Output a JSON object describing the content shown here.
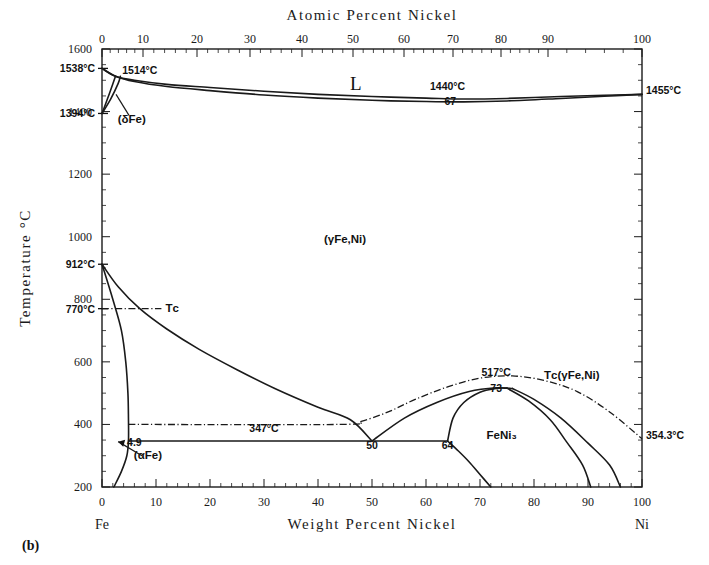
{
  "figure": {
    "caption": "(b)",
    "top_axis_title": "Atomic Percent Nickel",
    "bottom_axis_title": "Weight Percent Nickel",
    "left_axis_title": "Temperature °C",
    "left_end_label": "Fe",
    "right_end_label": "Ni",
    "frame": {
      "x0": 102,
      "x1": 642,
      "y_top": 49,
      "y_bottom": 487
    }
  },
  "chart_data": {
    "type": "line",
    "xlabel": "Weight Percent Nickel",
    "ylabel": "Temperature °C",
    "x2label": "Atomic Percent Nickel",
    "xlim": [
      0,
      100
    ],
    "ylim": [
      200,
      1600
    ],
    "grid": false,
    "legend": "none",
    "y_ticks": [
      200,
      400,
      600,
      800,
      1000,
      1200,
      1400,
      1600
    ],
    "x_ticks_bottom": [
      0,
      10,
      20,
      30,
      40,
      50,
      60,
      70,
      80,
      90,
      100
    ],
    "x_ticks_top": [
      0,
      10,
      20,
      30,
      40,
      50,
      60,
      70,
      80,
      90,
      100
    ],
    "x_top_pixel_positions": [
      102,
      143,
      197,
      250,
      302,
      353,
      404,
      453,
      501,
      548,
      642
    ],
    "special_y_ticks": [
      {
        "label": "1538°C",
        "value": 1538
      },
      {
        "label": "1394°C",
        "value": 1394
      },
      {
        "label": "912°C",
        "value": 912
      },
      {
        "label": "770°C",
        "value": 770
      }
    ],
    "phase_labels": [
      {
        "text": "L",
        "wt": 47,
        "temp": 1470
      },
      {
        "text": "(δFe)",
        "wt": 5.5,
        "temp": 1365
      },
      {
        "text": "(γFe,Ni)",
        "wt": 45,
        "temp": 980
      },
      {
        "text": "(αFe)",
        "wt": 8.5,
        "temp": 290
      },
      {
        "text": "FeNi₃",
        "wt": 74,
        "temp": 355
      },
      {
        "text": "Tᴄ",
        "wt": 13,
        "temp": 760
      },
      {
        "text": "Tᴄ(γFe,Ni)",
        "wt": 87,
        "temp": 545
      }
    ],
    "annotations": [
      {
        "text": "1514°C",
        "wt": 7,
        "temp": 1520
      },
      {
        "text": "1440°C",
        "wt": 64,
        "temp": 1470
      },
      {
        "text": "67",
        "wt": 64.5,
        "temp": 1420
      },
      {
        "text": "1455°C",
        "wt": 101,
        "temp": 1455
      },
      {
        "text": "347°C",
        "wt": 30,
        "temp": 375
      },
      {
        "text": "4.9",
        "wt": 6,
        "temp": 330
      },
      {
        "text": "50",
        "wt": 50,
        "temp": 320
      },
      {
        "text": "64",
        "wt": 64,
        "temp": 320
      },
      {
        "text": "517°C",
        "wt": 73,
        "temp": 555
      },
      {
        "text": "73",
        "wt": 73,
        "temp": 505
      },
      {
        "text": "354.3°C",
        "wt": 101,
        "temp": 354.3
      }
    ],
    "series": [
      {
        "name": "liquidus",
        "style": "solid",
        "points": [
          [
            0,
            1538
          ],
          [
            2.5,
            1513
          ],
          [
            6,
            1500
          ],
          [
            12,
            1487
          ],
          [
            20,
            1477
          ],
          [
            30,
            1465
          ],
          [
            40,
            1455
          ],
          [
            50,
            1448
          ],
          [
            60,
            1443
          ],
          [
            67,
            1440
          ],
          [
            75,
            1442
          ],
          [
            85,
            1448
          ],
          [
            93,
            1452
          ],
          [
            100,
            1455
          ]
        ]
      },
      {
        "name": "solidus",
        "style": "solid",
        "points": [
          [
            0,
            1538
          ],
          [
            2.5,
            1513
          ],
          [
            6,
            1496
          ],
          [
            12,
            1480
          ],
          [
            20,
            1467
          ],
          [
            30,
            1453
          ],
          [
            40,
            1443
          ],
          [
            50,
            1436
          ],
          [
            60,
            1432
          ],
          [
            67,
            1431
          ],
          [
            75,
            1434
          ],
          [
            85,
            1442
          ],
          [
            93,
            1449
          ],
          [
            100,
            1455
          ]
        ]
      },
      {
        "name": "delta-ferrite-boundary-left",
        "style": "solid",
        "points": [
          [
            0,
            1394
          ],
          [
            1.0,
            1440
          ],
          [
            2.0,
            1488
          ],
          [
            2.5,
            1513
          ]
        ]
      },
      {
        "name": "delta-gamma-boundary",
        "style": "solid",
        "points": [
          [
            0,
            1394
          ],
          [
            1.6,
            1440
          ],
          [
            3.0,
            1490
          ],
          [
            3.4,
            1513
          ]
        ]
      },
      {
        "name": "gamma-alpha-solvus-upper",
        "style": "solid",
        "points": [
          [
            0,
            912
          ],
          [
            3,
            840
          ],
          [
            7,
            770
          ],
          [
            12,
            705
          ],
          [
            18,
            640
          ],
          [
            25,
            575
          ],
          [
            32,
            515
          ],
          [
            40,
            455
          ],
          [
            46,
            415
          ],
          [
            50,
            347
          ]
        ]
      },
      {
        "name": "alpha-gamma-boundary-left",
        "style": "solid",
        "points": [
          [
            0,
            912
          ],
          [
            2.0,
            800
          ],
          [
            3.6,
            700
          ],
          [
            4.4,
            600
          ],
          [
            4.8,
            500
          ],
          [
            4.9,
            420
          ],
          [
            4.9,
            347
          ],
          [
            4.6,
            300
          ],
          [
            3.6,
            250
          ],
          [
            2.2,
            200
          ]
        ]
      },
      {
        "name": "Tc-alpha-line",
        "style": "dashdot",
        "points": [
          [
            0,
            770
          ],
          [
            11,
            770
          ]
        ]
      },
      {
        "name": "Tc-400-line",
        "style": "dashdot",
        "points": [
          [
            4.9,
            400
          ],
          [
            44,
            400
          ],
          [
            48,
            410
          ],
          [
            53,
            440
          ],
          [
            58,
            480
          ],
          [
            64,
            520
          ],
          [
            70,
            548
          ],
          [
            76,
            555
          ],
          [
            82,
            540
          ],
          [
            88,
            505
          ],
          [
            94,
            440
          ],
          [
            100,
            354.3
          ]
        ]
      },
      {
        "name": "eutectoid-347-line",
        "style": "solid",
        "points": [
          [
            4.9,
            347
          ],
          [
            50,
            347
          ],
          [
            64,
            347
          ]
        ]
      },
      {
        "name": "FeNi3-upper-left",
        "style": "solid",
        "points": [
          [
            50,
            347
          ],
          [
            56,
            420
          ],
          [
            62,
            470
          ],
          [
            68,
            505
          ],
          [
            73,
            517
          ],
          [
            76,
            515
          ]
        ]
      },
      {
        "name": "FeNi3-inner-left",
        "style": "solid",
        "points": [
          [
            64,
            347
          ],
          [
            65,
            420
          ],
          [
            67,
            470
          ],
          [
            70,
            503
          ],
          [
            73,
            515
          ],
          [
            75,
            516
          ]
        ]
      },
      {
        "name": "FeNi3-right-outer",
        "style": "solid",
        "points": [
          [
            76,
            515
          ],
          [
            80,
            480
          ],
          [
            85,
            420
          ],
          [
            90,
            340
          ],
          [
            94,
            270
          ],
          [
            96,
            200
          ]
        ]
      },
      {
        "name": "FeNi3-right-inner",
        "style": "solid",
        "points": [
          [
            75,
            516
          ],
          [
            79,
            475
          ],
          [
            83,
            415
          ],
          [
            86,
            345
          ],
          [
            89,
            270
          ],
          [
            90.5,
            200
          ]
        ]
      },
      {
        "name": "FeNi3-lower-left",
        "style": "solid",
        "points": [
          [
            64,
            347
          ],
          [
            66,
            315
          ],
          [
            68,
            280
          ],
          [
            70,
            240
          ],
          [
            72,
            200
          ]
        ]
      }
    ]
  }
}
